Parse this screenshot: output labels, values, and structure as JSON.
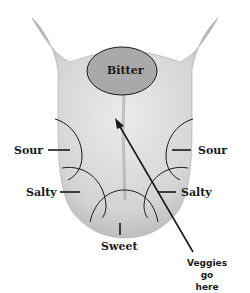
{
  "diagram": {
    "zones": {
      "bitter": "Bitter",
      "sour_left": "Sour",
      "sour_right": "Sour",
      "salty_left": "Salty",
      "salty_right": "Salty",
      "sweet": "Sweet"
    },
    "annotation": {
      "line1": "Veggies go",
      "line2": "here"
    },
    "colors": {
      "tongue_fill": "#d9d9d9",
      "tongue_shade": "#bdbdbd",
      "bitter_fill": "#a9a9a9",
      "outline": "#1a1a1a"
    }
  }
}
